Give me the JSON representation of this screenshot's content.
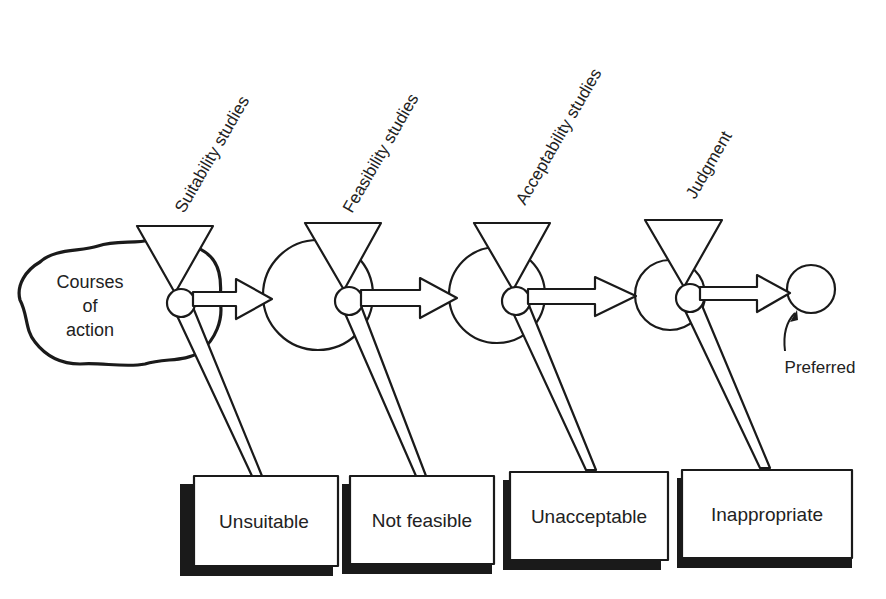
{
  "diagram": {
    "source": {
      "label_lines": [
        "Courses",
        "of",
        "action"
      ]
    },
    "stages": [
      {
        "label": "Suitability studies",
        "reject_label": "Unsuitable"
      },
      {
        "label": "Feasibility studies",
        "reject_label": "Not feasible"
      },
      {
        "label": "Acceptability studies",
        "reject_label": "Unacceptable"
      },
      {
        "label": "Judgment",
        "reject_label": "Inappropriate"
      }
    ],
    "result": {
      "label": "Preferred"
    }
  }
}
